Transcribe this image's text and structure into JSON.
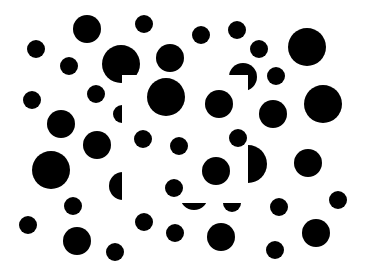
{
  "figure": {
    "title": "Illusory contour dot pattern",
    "width": 366,
    "height": 275,
    "background_color": "#ffffff",
    "dot_color": "#000000",
    "occluder": {
      "x": 122,
      "y": 75,
      "width": 126,
      "height": 128,
      "color": "#ffffff"
    },
    "background_dots": [
      {
        "cx": 87,
        "cy": 29,
        "r": 14
      },
      {
        "cx": 144,
        "cy": 24,
        "r": 9
      },
      {
        "cx": 201,
        "cy": 35,
        "r": 9
      },
      {
        "cx": 237,
        "cy": 30,
        "r": 9
      },
      {
        "cx": 36,
        "cy": 49,
        "r": 9
      },
      {
        "cx": 69,
        "cy": 66,
        "r": 9
      },
      {
        "cx": 121,
        "cy": 64,
        "r": 19
      },
      {
        "cx": 170,
        "cy": 58,
        "r": 14
      },
      {
        "cx": 243,
        "cy": 77,
        "r": 14
      },
      {
        "cx": 259,
        "cy": 49,
        "r": 9
      },
      {
        "cx": 307,
        "cy": 47,
        "r": 19
      },
      {
        "cx": 276,
        "cy": 76,
        "r": 9
      },
      {
        "cx": 32,
        "cy": 100,
        "r": 9
      },
      {
        "cx": 96,
        "cy": 94,
        "r": 9
      },
      {
        "cx": 122,
        "cy": 114,
        "r": 9
      },
      {
        "cx": 174,
        "cy": 98,
        "r": 19
      },
      {
        "cx": 61,
        "cy": 124,
        "r": 14
      },
      {
        "cx": 273,
        "cy": 114,
        "r": 14
      },
      {
        "cx": 323,
        "cy": 104,
        "r": 19
      },
      {
        "cx": 133,
        "cy": 139,
        "r": 9
      },
      {
        "cx": 97,
        "cy": 145,
        "r": 14
      },
      {
        "cx": 51,
        "cy": 170,
        "r": 19
      },
      {
        "cx": 123,
        "cy": 186,
        "r": 14
      },
      {
        "cx": 248,
        "cy": 164,
        "r": 19
      },
      {
        "cx": 308,
        "cy": 163,
        "r": 14
      },
      {
        "cx": 194,
        "cy": 196,
        "r": 14
      },
      {
        "cx": 232,
        "cy": 203,
        "r": 9
      },
      {
        "cx": 73,
        "cy": 206,
        "r": 9
      },
      {
        "cx": 28,
        "cy": 225,
        "r": 9
      },
      {
        "cx": 338,
        "cy": 200,
        "r": 9
      },
      {
        "cx": 279,
        "cy": 207,
        "r": 9
      },
      {
        "cx": 144,
        "cy": 222,
        "r": 9
      },
      {
        "cx": 77,
        "cy": 241,
        "r": 14
      },
      {
        "cx": 115,
        "cy": 252,
        "r": 9
      },
      {
        "cx": 175,
        "cy": 233,
        "r": 9
      },
      {
        "cx": 221,
        "cy": 237,
        "r": 14
      },
      {
        "cx": 316,
        "cy": 233,
        "r": 14
      },
      {
        "cx": 275,
        "cy": 250,
        "r": 9
      }
    ],
    "foreground_dots": [
      {
        "cx": 166,
        "cy": 97,
        "r": 19
      },
      {
        "cx": 219,
        "cy": 104,
        "r": 14
      },
      {
        "cx": 143,
        "cy": 139,
        "r": 9
      },
      {
        "cx": 179,
        "cy": 146,
        "r": 9
      },
      {
        "cx": 238,
        "cy": 138,
        "r": 9
      },
      {
        "cx": 216,
        "cy": 171,
        "r": 14
      },
      {
        "cx": 174,
        "cy": 188,
        "r": 9
      }
    ]
  }
}
